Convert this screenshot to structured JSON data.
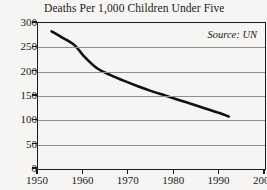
{
  "chart_data": {
    "type": "line",
    "title": "Deaths Per 1,000 Children Under Five",
    "xlabel": "",
    "ylabel": "",
    "xlim": [
      1950,
      2000
    ],
    "ylim": [
      0,
      300
    ],
    "grid": true,
    "legend_position": "none",
    "annotations": [
      {
        "name": "source",
        "text": "Source: UN"
      }
    ],
    "xticks": [
      1950,
      1960,
      1970,
      1980,
      1990,
      2000
    ],
    "xtick_labels": [
      "1950",
      "1960",
      "1970",
      "1980",
      "1990",
      "2000"
    ],
    "yticks": [
      0,
      50,
      100,
      150,
      200,
      250,
      300
    ],
    "ytick_labels": [
      "0",
      "50",
      "100",
      "150",
      "200",
      "250",
      "300"
    ],
    "series": [
      {
        "name": "Deaths per 1,000 children under five",
        "color": "#111111",
        "x": [
          1953,
          1955,
          1958,
          1960,
          1963,
          1966,
          1969,
          1972,
          1975,
          1978,
          1981,
          1984,
          1987,
          1990,
          1992
        ],
        "values": [
          283,
          272,
          255,
          233,
          207,
          193,
          181,
          170,
          160,
          151,
          142,
          133,
          124,
          115,
          108
        ]
      }
    ]
  },
  "figure": {
    "background_color": "#f6f5f3",
    "axis_color": "#1b1b1b",
    "grid_color": "#8e8e8e"
  }
}
